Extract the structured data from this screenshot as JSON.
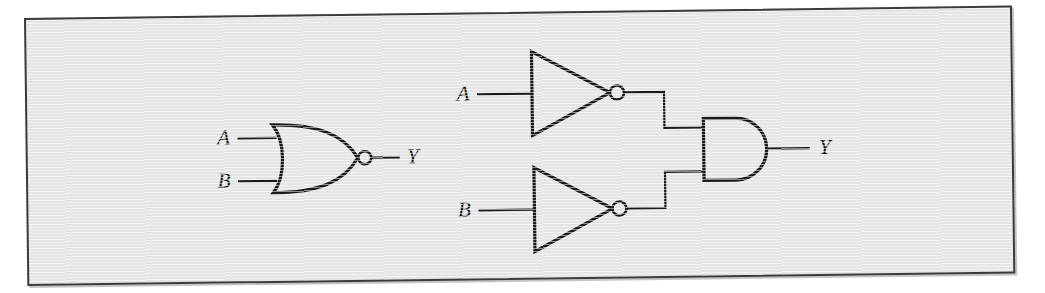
{
  "figure": {
    "caption": "",
    "panel_background": "#e7e7e7",
    "ink_color": "#1b1b1b",
    "page_background": "#ffffff"
  },
  "circuits": [
    {
      "id": "nor-gate-circuit",
      "name": "NOR gate",
      "gate_type": "NOR",
      "inputs": [
        {
          "name": "input-a",
          "label": "A"
        },
        {
          "name": "input-b",
          "label": "B"
        }
      ],
      "outputs": [
        {
          "name": "output-y",
          "label": "Y"
        }
      ],
      "has_inversion_bubble": true
    },
    {
      "id": "inverters-and-circuit",
      "name": "Two inverters feeding an AND gate",
      "gate_type": "AND",
      "inputs": [
        {
          "name": "input-a",
          "label": "A"
        },
        {
          "name": "input-b",
          "label": "B"
        }
      ],
      "outputs": [
        {
          "name": "output-y",
          "label": "Y"
        }
      ],
      "subgates": [
        {
          "name": "inverter-top",
          "gate_type": "NOT",
          "has_inversion_bubble": true
        },
        {
          "name": "inverter-bottom",
          "gate_type": "NOT",
          "has_inversion_bubble": true
        }
      ]
    }
  ],
  "labels": {
    "left_input_a": "A",
    "left_input_b": "B",
    "left_output_y": "Y",
    "right_input_a": "A",
    "right_input_b": "B",
    "right_output_y": "Y"
  }
}
